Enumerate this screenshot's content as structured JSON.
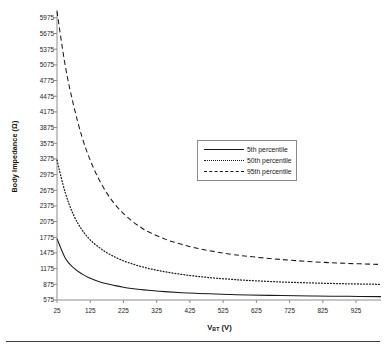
{
  "chart_data": {
    "type": "line",
    "title": "",
    "xlabel": "V_BT (V)",
    "xlabel_main": "V",
    "xlabel_sub": "BT",
    "xlabel_unit": "(V)",
    "ylabel": "Body Impedance (Ω)",
    "xlim": [
      25,
      1000
    ],
    "ylim": [
      575,
      6125
    ],
    "grid": false,
    "legend_position": "center",
    "xticks": [
      25,
      125,
      225,
      325,
      425,
      525,
      625,
      725,
      825,
      925
    ],
    "yticks": [
      575,
      875,
      1175,
      1475,
      1775,
      2075,
      2375,
      2675,
      2975,
      3275,
      3575,
      3875,
      4175,
      4475,
      4775,
      5075,
      5375,
      5675,
      5975
    ],
    "x": [
      25,
      50,
      75,
      100,
      125,
      150,
      175,
      200,
      225,
      250,
      275,
      300,
      350,
      400,
      450,
      500,
      550,
      600,
      700,
      800,
      900,
      1000
    ],
    "series": [
      {
        "name": "5th percentile",
        "style": "solid",
        "values": [
          1750,
          1375,
          1190,
          1075,
          990,
          930,
          885,
          850,
          820,
          795,
          775,
          760,
          735,
          715,
          700,
          690,
          680,
          672,
          660,
          650,
          645,
          640
        ]
      },
      {
        "name": "50th percentile",
        "style": "dotted",
        "values": [
          3250,
          2625,
          2200,
          1920,
          1725,
          1590,
          1480,
          1395,
          1325,
          1270,
          1220,
          1180,
          1115,
          1065,
          1025,
          995,
          970,
          950,
          920,
          900,
          885,
          875
        ]
      },
      {
        "name": "95th percentile",
        "style": "dashed",
        "values": [
          6100,
          5050,
          4300,
          3700,
          3250,
          2900,
          2620,
          2400,
          2230,
          2090,
          1975,
          1880,
          1740,
          1640,
          1560,
          1500,
          1450,
          1410,
          1350,
          1305,
          1275,
          1255
        ]
      }
    ],
    "legend": [
      {
        "label": "5th percentile",
        "style": "solid"
      },
      {
        "label": "50th percentile",
        "style": "dotted"
      },
      {
        "label": "95th percentile",
        "style": "dashed"
      }
    ]
  }
}
